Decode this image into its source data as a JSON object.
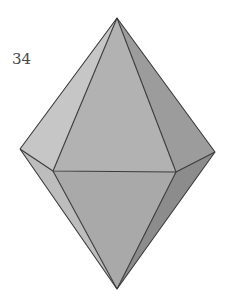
{
  "figure": {
    "label": "34",
    "shape": "hexagonal-bipyramid",
    "edge_color": "#3a3a3a",
    "vertices": {
      "top": [
        117,
        18
      ],
      "bottom": [
        117,
        289
      ],
      "left": [
        20,
        149
      ],
      "right": [
        215,
        152
      ],
      "front_left": [
        53,
        171
      ],
      "front_right": [
        176,
        172
      ]
    },
    "faces": {
      "upper_left": "#c6c6c6",
      "upper_front": "#b2b2b2",
      "upper_right": "#9c9c9c",
      "lower_left": "#bdbdbd",
      "lower_front": "#a9a9a9",
      "lower_right": "#8c8c8c"
    }
  }
}
